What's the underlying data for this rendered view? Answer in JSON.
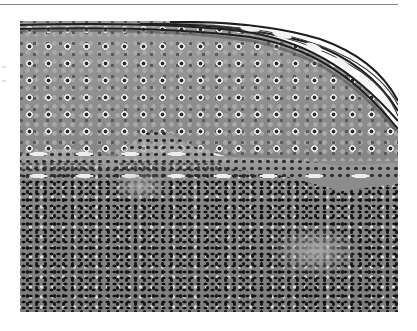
{
  "figure": {
    "type": "histology-micrograph",
    "stain": "grayscale",
    "regions": [
      {
        "name": "stratum-corneum",
        "position": "top-right edge"
      },
      {
        "name": "epidermis",
        "position": "upper half"
      },
      {
        "name": "dermal-epidermal-junction",
        "position": "middle"
      },
      {
        "name": "dermis-inflammatory-infiltrate",
        "position": "lower half"
      }
    ],
    "colors": {
      "background": "#ffffff",
      "rule": "#8a8a8a",
      "epidermis": "#929292",
      "nuclei": "#151515",
      "halo": "#e8e8e8"
    }
  }
}
